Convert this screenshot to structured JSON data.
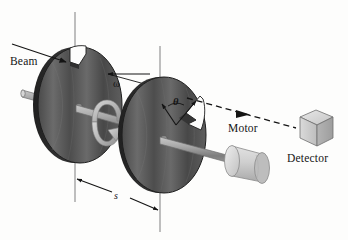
{
  "figure": {
    "background_color": "#fdfdfc",
    "ink_color": "#141414"
  },
  "labels": {
    "beam": "Beam",
    "motor": "Motor",
    "detector": "Detector",
    "angular_velocity": "ω",
    "angle": "θ",
    "separation": "s"
  },
  "components": {
    "disk_near": {
      "name": "first rotating disk with notch",
      "center_x": 75,
      "center_y": 105,
      "radius_x": 42,
      "radius_y": 58,
      "fill_dark": "#3c3c3c",
      "fill_light": "#6e6e6e",
      "notch_position": "top"
    },
    "disk_far": {
      "name": "second rotating disk with notch",
      "center_x": 160,
      "center_y": 135,
      "radius_x": 42,
      "radius_y": 58,
      "fill_dark": "#3c3c3c",
      "fill_light": "#6e6e6e",
      "notch_position": "upper-right"
    },
    "shaft": {
      "name": "common axle shaft",
      "color": "#9a9a9a",
      "from_x": 22,
      "from_y": 94,
      "to_x": 232,
      "to_y": 151
    },
    "motor": {
      "name": "drive motor cylinder",
      "center_x": 250,
      "center_y": 156,
      "fill": "#cfcfcf"
    },
    "detector": {
      "name": "detector cube",
      "center_x": 315,
      "center_y": 130,
      "fill": "#d2d2d2"
    },
    "reference_line_left": {
      "x": 75,
      "y_top": 12,
      "y_bottom": 202
    },
    "reference_line_right": {
      "x": 160,
      "y_top": 46,
      "y_bottom": 232
    },
    "rotation_arrow": {
      "name": "circular rotation arrow about shaft",
      "center_x": 106,
      "center_y": 122,
      "fill": "#b9b9b9"
    },
    "beam_in": {
      "name": "incoming beam arrow",
      "from_x": 12,
      "from_y": 44,
      "to_x": 62,
      "to_y": 62
    },
    "beam_out": {
      "name": "outgoing dashed beam to detector",
      "from_x": 186,
      "from_y": 98,
      "to_x": 296,
      "to_y": 128,
      "style": "dashed"
    },
    "dimension_s": {
      "name": "separation dimension arrow",
      "from_x": 76,
      "from_y": 178,
      "to_x": 159,
      "to_y": 210
    }
  }
}
